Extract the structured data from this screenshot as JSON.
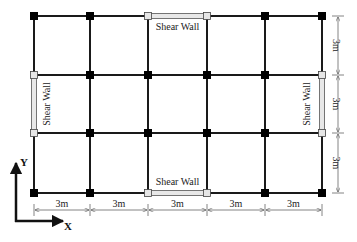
{
  "diagram": {
    "type": "structural-plan",
    "grid": {
      "columns_x": [
        34,
        90,
        148,
        207,
        265,
        322
      ],
      "rows_y": [
        16,
        75,
        133,
        193
      ],
      "beam_color": "#111111",
      "column_node_color": "#000000",
      "wall_node_color": "#e6e6e6"
    },
    "shear_walls": [
      {
        "id": "top",
        "label": "Shear Wall",
        "orientation": "horizontal"
      },
      {
        "id": "bottom",
        "label": "Shear Wall",
        "orientation": "horizontal"
      },
      {
        "id": "left",
        "label": "Shear Wall",
        "orientation": "vertical"
      },
      {
        "id": "right",
        "label": "Shear Wall",
        "orientation": "vertical"
      }
    ],
    "dimensions": {
      "horizontal": [
        "3m",
        "3m",
        "3m",
        "3m",
        "3m"
      ],
      "vertical": [
        "3m",
        "3m",
        "3m"
      ]
    },
    "axes": {
      "x_label": "X",
      "y_label": "Y"
    }
  }
}
